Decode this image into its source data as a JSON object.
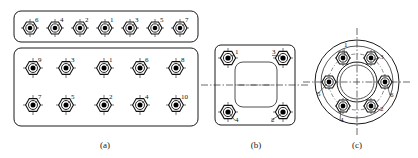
{
  "figure": {
    "background_color": "#ffffff",
    "line_color": "#111111",
    "captions": [
      {
        "key": "a",
        "label": "(a)",
        "x": 105,
        "y": 148
      },
      {
        "key": "b",
        "label": "(b)",
        "x": 256,
        "y": 148
      },
      {
        "key": "c",
        "label": "(c)",
        "x": 357,
        "y": 148
      }
    ]
  },
  "panel_a": {
    "caption": "(a)",
    "top_strip": {
      "shape": "rounded-rectangle",
      "x": 14,
      "y": 11,
      "width": 184,
      "height": 31,
      "radius": 7,
      "bolt_count": 7,
      "sequence": [
        6,
        4,
        2,
        1,
        3,
        5,
        7
      ],
      "bolts": [
        {
          "n": 6,
          "cx": 30,
          "cy": 28
        },
        {
          "n": 4,
          "cx": 55,
          "cy": 28
        },
        {
          "n": 2,
          "cx": 80,
          "cy": 28
        },
        {
          "n": 1,
          "cx": 105,
          "cy": 28
        },
        {
          "n": 3,
          "cx": 130,
          "cy": 28
        },
        {
          "n": 5,
          "cx": 155,
          "cy": 28
        },
        {
          "n": 7,
          "cx": 180,
          "cy": 28
        }
      ]
    },
    "lower_panel": {
      "shape": "rounded-rectangle",
      "x": 14,
      "y": 48,
      "width": 184,
      "height": 78,
      "radius": 7,
      "bolt_count": 10,
      "row_top_sequence": [
        9,
        3,
        1,
        6,
        8
      ],
      "row_bottom_sequence": [
        7,
        5,
        2,
        4,
        10
      ],
      "bolts": [
        {
          "n": 9,
          "cx": 33,
          "cy": 68
        },
        {
          "n": 3,
          "cx": 66,
          "cy": 68
        },
        {
          "n": 1,
          "cx": 104,
          "cy": 68
        },
        {
          "n": 6,
          "cx": 140,
          "cy": 68
        },
        {
          "n": 8,
          "cx": 176,
          "cy": 68
        },
        {
          "n": 7,
          "cx": 33,
          "cy": 105
        },
        {
          "n": 5,
          "cx": 66,
          "cy": 105
        },
        {
          "n": 2,
          "cx": 104,
          "cy": 105
        },
        {
          "n": 4,
          "cx": 140,
          "cy": 105
        },
        {
          "n": 10,
          "cx": 176,
          "cy": 105
        }
      ]
    }
  },
  "panel_b": {
    "caption": "(b)",
    "plate": {
      "shape": "rounded-square",
      "x": 215,
      "y": 45,
      "width": 80,
      "height": 80,
      "radius": 6
    },
    "inner_window": {
      "shape": "rounded-rectangle",
      "x": 235,
      "y": 62,
      "width": 42,
      "height": 45,
      "radius": 8
    },
    "bolt_count": 4,
    "sequence": [
      1,
      3,
      4,
      2
    ],
    "bolts": [
      {
        "n": 1,
        "cx": 228,
        "cy": 58,
        "label_dx": 7,
        "label_dy": -4
      },
      {
        "n": 3,
        "cx": 283,
        "cy": 58,
        "label_dx": -11,
        "label_dy": -4
      },
      {
        "n": 4,
        "cx": 228,
        "cy": 112,
        "label_dx": 7,
        "label_dy": 10
      },
      {
        "n": 2,
        "cx": 283,
        "cy": 112,
        "label_dx": -12,
        "label_dy": 10
      }
    ],
    "centerlines": {
      "h_y": 85,
      "v_x": 256
    }
  },
  "panel_c": {
    "caption": "(c)",
    "flange": {
      "shape": "circular",
      "cx": 357,
      "cy": 82,
      "outer_radius": 42,
      "rim_radius": 36,
      "bore_radius": 20,
      "bore_inner_radius": 17,
      "pitch_circle_radius": 28
    },
    "bolt_count": 6,
    "sequence": [
      1,
      3,
      6,
      2,
      4,
      5
    ],
    "bolts": [
      {
        "n": 1,
        "cx": 343,
        "cy": 58,
        "label_dx": 1,
        "label_dy": -11
      },
      {
        "n": 3,
        "cx": 371,
        "cy": 58,
        "label_dx": 9,
        "label_dy": 1
      },
      {
        "n": 6,
        "cx": 385,
        "cy": 82,
        "label_dx": 5,
        "label_dy": 15
      },
      {
        "n": 2,
        "cx": 371,
        "cy": 106,
        "label_dx": 9,
        "label_dy": 5
      },
      {
        "n": 4,
        "cx": 343,
        "cy": 106,
        "label_dx": -3,
        "label_dy": 16
      },
      {
        "n": 5,
        "cx": 329,
        "cy": 82,
        "label_dx": -12,
        "label_dy": 14
      }
    ],
    "centerlines": {
      "h_y": 82,
      "v_x": 357
    }
  }
}
